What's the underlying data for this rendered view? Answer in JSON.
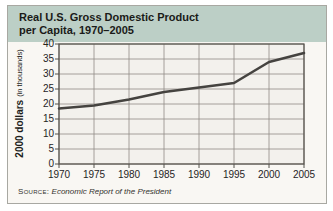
{
  "figure": {
    "title_line1": "Real U.S. Gross Domestic Product",
    "title_line2": "per Capita, 1970–2005",
    "source_prefix": "Source:",
    "source_text": "Economic Report of the President"
  },
  "chart_data": {
    "type": "line",
    "title": "Real U.S. Gross Domestic Product per Capita, 1970–2005",
    "x": [
      1970,
      1975,
      1980,
      1985,
      1990,
      1995,
      2000,
      2005
    ],
    "values": [
      18.5,
      19.5,
      21.5,
      24,
      25.5,
      27,
      34,
      37
    ],
    "series_name": "Real GDP per capita (2000 dollars, thousands)",
    "ylabel_bold": "2000 dollars",
    "ylabel_note": "(in thousands)",
    "ylim": [
      0,
      40
    ],
    "y_ticks": [
      0,
      5,
      10,
      15,
      20,
      25,
      30,
      35,
      40
    ],
    "y_ticks_desc": [
      "40",
      "35",
      "30",
      "25",
      "20",
      "15",
      "10",
      "5",
      "0"
    ],
    "x_labels": [
      "1970",
      "1975",
      "1980",
      "1985",
      "1990",
      "1995",
      "2000",
      "2005"
    ],
    "grid": true,
    "legend": "none",
    "source": "Economic Report of the President"
  },
  "colors": {
    "header_bg": "#bccfc6",
    "figure_bg": "#f9f7f3",
    "plot_bg": "#f3f1ed",
    "gridline": "#908c86",
    "frame": "#55524c",
    "line": "#454340",
    "text": "#1a1a18"
  }
}
